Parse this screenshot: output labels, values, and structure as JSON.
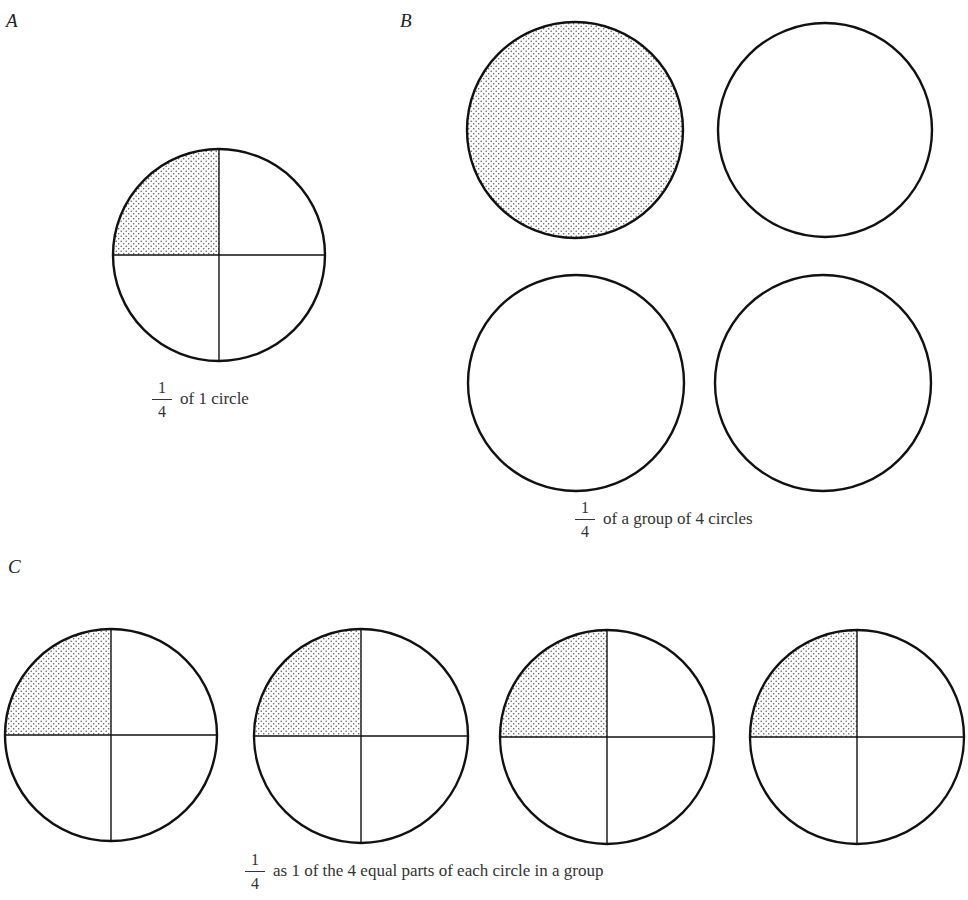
{
  "panels": {
    "A": {
      "label": "A",
      "caption": {
        "numerator": "1",
        "denominator": "4",
        "text": "of 1 circle"
      },
      "circles": [
        {
          "cx": 219,
          "cy": 255,
          "r": 106,
          "divided": true,
          "shaded": "top-left-quarter"
        }
      ]
    },
    "B": {
      "label": "B",
      "caption": {
        "numerator": "1",
        "denominator": "4",
        "text": "of a group of 4 circles"
      },
      "circles": [
        {
          "cx": 575,
          "cy": 130,
          "r": 108,
          "divided": false,
          "shaded": "whole"
        },
        {
          "cx": 825,
          "cy": 130,
          "r": 107,
          "divided": false,
          "shaded": "none"
        },
        {
          "cx": 576,
          "cy": 383,
          "r": 108,
          "divided": false,
          "shaded": "none"
        },
        {
          "cx": 823,
          "cy": 383,
          "r": 108,
          "divided": false,
          "shaded": "none"
        }
      ]
    },
    "C": {
      "label": "C",
      "caption": {
        "numerator": "1",
        "denominator": "4",
        "text": "as 1 of the 4 equal parts of each circle in a group"
      },
      "circles": [
        {
          "cx": 111,
          "cy": 735,
          "r": 106,
          "divided": true,
          "shaded": "top-left-quarter"
        },
        {
          "cx": 361,
          "cy": 736,
          "r": 107,
          "divided": true,
          "shaded": "top-left-quarter"
        },
        {
          "cx": 607,
          "cy": 737,
          "r": 107,
          "divided": true,
          "shaded": "top-left-quarter"
        },
        {
          "cx": 857,
          "cy": 737,
          "r": 107,
          "divided": true,
          "shaded": "top-left-quarter"
        }
      ]
    }
  },
  "colors": {
    "stroke": "#111111",
    "stipple": "#555555",
    "background": "#ffffff"
  }
}
